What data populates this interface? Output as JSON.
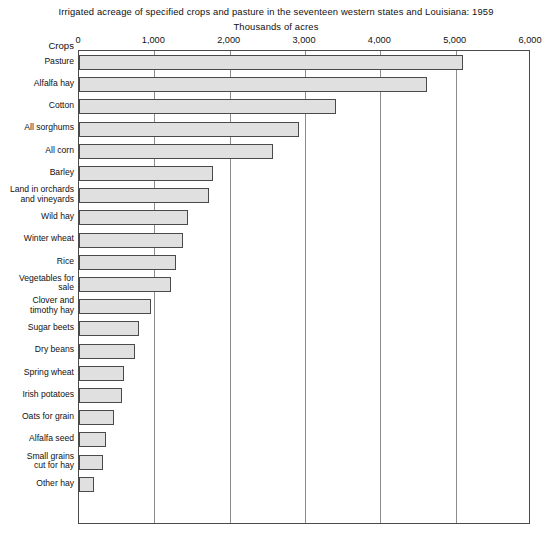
{
  "chart_data": {
    "type": "bar",
    "orientation": "horizontal",
    "title": "Irrigated acreage of specified crops and pasture in the seventeen western states and Louisiana: 1959",
    "subtitle": "Thousands of acres",
    "xlabel": "Thousands of acres",
    "ylabel": "Crops",
    "xlim": [
      0,
      6000
    ],
    "xticks": [
      0,
      1000,
      2000,
      3000,
      4000,
      5000,
      6000
    ],
    "xticklabels": [
      "0",
      "1,000",
      "2,000",
      "3,000",
      "4,000",
      "5,000",
      "6,000"
    ],
    "grid": "vertical",
    "legend": "none",
    "categories": [
      "Pasture",
      "Alfalfa hay",
      "Cotton",
      "All sorghums",
      "All corn",
      "Barley",
      "Land in orchards and vineyards",
      "Wild hay",
      "Winter wheat",
      "Rice",
      "Vegetables for sale",
      "Clover and timothy hay",
      "Sugar beets",
      "Dry beans",
      "Spring wheat",
      "Irish potatoes",
      "Oats for grain",
      "Alfalfa seed",
      "Small grains cut for hay",
      "Other hay"
    ],
    "category_lines": [
      [
        "Pasture",
        ""
      ],
      [
        "Alfalfa hay",
        ""
      ],
      [
        "Cotton",
        ""
      ],
      [
        "All sorghums",
        ""
      ],
      [
        "All corn",
        ""
      ],
      [
        "Barley",
        ""
      ],
      [
        "Land in orchards",
        "and vineyards"
      ],
      [
        "Wild hay",
        ""
      ],
      [
        "Winter wheat",
        ""
      ],
      [
        "Rice",
        ""
      ],
      [
        "Vegetables for",
        "sale"
      ],
      [
        "Clover and",
        "timothy hay"
      ],
      [
        "Sugar beets",
        ""
      ],
      [
        "Dry beans",
        ""
      ],
      [
        "Spring wheat",
        ""
      ],
      [
        "Irish potatoes",
        ""
      ],
      [
        "Oats for grain",
        ""
      ],
      [
        "Alfalfa seed",
        ""
      ],
      [
        "Small grains",
        "cut for hay"
      ],
      [
        "Other hay",
        ""
      ]
    ],
    "values": [
      5100,
      4620,
      3410,
      2920,
      2570,
      1780,
      1730,
      1450,
      1380,
      1290,
      1220,
      960,
      800,
      745,
      600,
      570,
      465,
      360,
      320,
      200
    ],
    "bar_fill_color": "#e0e0e0",
    "bar_edge_color": "#4a4a4a",
    "gridline_color": "#8c8c8c",
    "background_color": "#ffffff"
  },
  "axis": {
    "y_header": "Crops"
  }
}
